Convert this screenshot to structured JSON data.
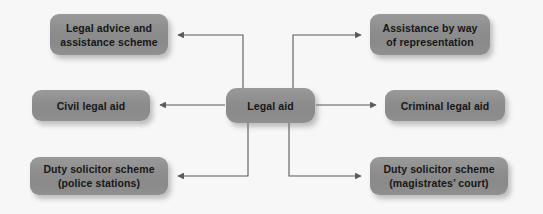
{
  "diagram": {
    "title": "Legal aid",
    "type": "radial-flowchart",
    "background_color": "#f7f7f7",
    "node_fill_color": "#8e8e8e",
    "node_text_color": "#171717",
    "connector_color": "#595959",
    "center_node": {
      "id": "legal-aid",
      "label": "Legal aid",
      "lines": [
        "Legal aid"
      ],
      "x": 226,
      "y": 88,
      "width": 89,
      "height": 35
    },
    "nodes": [
      {
        "id": "legal-advice-and-assistance-scheme",
        "lines": [
          "Legal advice and",
          "assistance scheme"
        ],
        "side": "left",
        "row": "top",
        "x": 50,
        "y": 14,
        "width": 118,
        "height": 41
      },
      {
        "id": "civil-legal-aid",
        "lines": [
          "Civil legal aid"
        ],
        "side": "left",
        "row": "middle",
        "x": 32,
        "y": 90,
        "width": 118,
        "height": 31
      },
      {
        "id": "duty-solicitor-scheme-police-stations",
        "lines": [
          "Duty solicitor scheme",
          "(police stations)"
        ],
        "side": "left",
        "row": "bottom",
        "x": 30,
        "y": 157,
        "width": 138,
        "height": 38
      },
      {
        "id": "assistance-by-way-of-representation",
        "lines": [
          "Assistance by way",
          "of representation"
        ],
        "side": "right",
        "row": "top",
        "x": 370,
        "y": 14,
        "width": 120,
        "height": 41
      },
      {
        "id": "criminal-legal-aid",
        "lines": [
          "Criminal legal aid"
        ],
        "side": "right",
        "row": "middle",
        "x": 385,
        "y": 90,
        "width": 120,
        "height": 31
      },
      {
        "id": "duty-solicitor-scheme-magistrates-court",
        "lines": [
          "Duty solicitor scheme",
          "(magistrates’ court)"
        ],
        "side": "right",
        "row": "bottom",
        "x": 370,
        "y": 157,
        "width": 138,
        "height": 38
      }
    ],
    "connectors": [
      {
        "id": "connector-to-legal-advice-and-assistance-scheme",
        "from": "legal-aid",
        "to": "legal-advice-and-assistance-scheme",
        "arrow": "to"
      },
      {
        "id": "connector-to-civil-legal-aid",
        "from": "legal-aid",
        "to": "civil-legal-aid",
        "arrow": "to"
      },
      {
        "id": "connector-to-duty-solicitor-scheme-police-stations",
        "from": "legal-aid",
        "to": "duty-solicitor-scheme-police-stations",
        "arrow": "to"
      },
      {
        "id": "connector-to-assistance-by-way-of-representation",
        "from": "legal-aid",
        "to": "assistance-by-way-of-representation",
        "arrow": "to"
      },
      {
        "id": "connector-to-criminal-legal-aid",
        "from": "legal-aid",
        "to": "criminal-legal-aid",
        "arrow": "to"
      },
      {
        "id": "connector-to-duty-solicitor-scheme-magistrates-court",
        "from": "legal-aid",
        "to": "duty-solicitor-scheme-magistrates-court",
        "arrow": "to"
      }
    ]
  }
}
